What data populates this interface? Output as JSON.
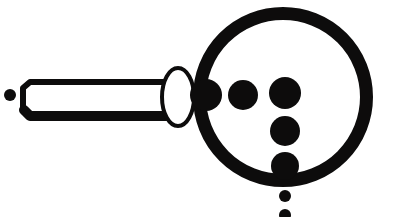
{
  "canvas": {
    "width": 393,
    "height": 217,
    "background_color": "#ffffff",
    "ink_color": "#0d0c0c",
    "title": "Magnifying glass with dots"
  },
  "figure": {
    "name": "magnifying-glass-with-dots",
    "style": "solid black line art on white",
    "lens": {
      "label": "lens-ring",
      "center_x": 283,
      "center_y": 97,
      "outer_radius": 90,
      "stroke_width": 13,
      "fill": "none",
      "stroke_color": "#0d0c0c"
    },
    "handle": {
      "label": "handle-rod",
      "left_x": 21,
      "right_x": 176,
      "top_y": 82,
      "bottom_y": 115,
      "fill": "#ffffff",
      "stroke_color": "#0d0c0c",
      "stroke_width": 6,
      "bottom_stroke_width": 10,
      "notch_x": 30
    },
    "ferrule": {
      "label": "ferrule-ellipse",
      "center_x": 178,
      "center_y": 97,
      "radius_x": 16,
      "radius_y": 29,
      "fill": "#ffffff",
      "stroke_color": "#0d0c0c",
      "stroke_width": 4
    },
    "stray_dot": {
      "label": "stray-dot-left",
      "center_x": 10,
      "center_y": 95,
      "radius": 6,
      "fill": "#0d0c0c"
    },
    "dots": [
      {
        "label": "dot-row-1",
        "center_x": 206,
        "center_y": 95,
        "radius": 16,
        "fill": "#0d0c0c"
      },
      {
        "label": "dot-row-2",
        "center_x": 243,
        "center_y": 95,
        "radius": 15,
        "fill": "#0d0c0c"
      },
      {
        "label": "dot-row-3",
        "center_x": 285,
        "center_y": 93,
        "radius": 16,
        "fill": "#0d0c0c"
      },
      {
        "label": "dot-col-1",
        "center_x": 285,
        "center_y": 131,
        "radius": 15,
        "fill": "#0d0c0c"
      },
      {
        "label": "dot-col-2",
        "center_x": 285,
        "center_y": 166,
        "radius": 14,
        "fill": "#0d0c0c"
      },
      {
        "label": "dot-col-3",
        "center_x": 285,
        "center_y": 196,
        "radius": 6,
        "fill": "#0d0c0c"
      },
      {
        "label": "dot-col-4",
        "center_x": 285,
        "center_y": 215,
        "radius": 6,
        "fill": "#0d0c0c"
      }
    ],
    "dot_count": 7,
    "row_dot_count": 3,
    "column_dot_count": 4
  }
}
